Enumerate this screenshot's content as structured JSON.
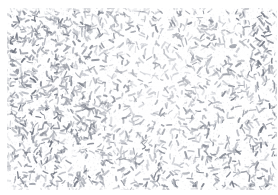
{
  "image": {
    "kind": "micrograph",
    "modality": "brightfield-light-microscopy",
    "title": "",
    "caption": "",
    "width_px": 278,
    "height_px": 195,
    "background_color": "#fbfbfb",
    "paper_color": "#ffffff",
    "specimen_color_dark": "#6f7480",
    "specimen_color_mid": "#969aa4",
    "specimen_color_light": "#b9bcc4",
    "speckle_color": "#d7d9de",
    "margins_px": {
      "top": 8,
      "left": 7,
      "bottom": 5,
      "right": 1
    },
    "overlay_text": "",
    "scale_bar_label": "",
    "annotations": []
  },
  "specimen": {
    "object_name": "bacilli-rod-shaped-bodies",
    "object_count": 2600,
    "length_px_min": 2.0,
    "length_px_max": 6.5,
    "thickness_px_min": 1.0,
    "thickness_px_max": 2.1,
    "orientation": "random",
    "distribution": "clustered-random",
    "speckle_count": 5200,
    "density_field": {
      "comment": "relative local density multipliers over a coarse grid, columns left->right, rows top->bottom",
      "cols": 8,
      "rows": 6,
      "values": [
        [
          1.15,
          1.2,
          1.1,
          0.95,
          0.7,
          0.85,
          1.0,
          1.05
        ],
        [
          1.25,
          1.2,
          1.05,
          0.9,
          0.6,
          0.8,
          1.05,
          1.1
        ],
        [
          1.2,
          1.15,
          1.05,
          0.8,
          0.55,
          0.85,
          1.0,
          1.05
        ],
        [
          1.2,
          1.25,
          1.15,
          0.95,
          0.75,
          0.9,
          0.95,
          1.1
        ],
        [
          1.25,
          1.2,
          1.15,
          1.0,
          0.85,
          0.95,
          1.0,
          1.15
        ],
        [
          1.1,
          1.15,
          1.1,
          1.0,
          0.9,
          1.0,
          1.05,
          1.1
        ]
      ]
    },
    "seed": 20240517
  },
  "viewer": {
    "name": "specimen-field-of-view",
    "zoom_label": "",
    "status_text": ""
  }
}
